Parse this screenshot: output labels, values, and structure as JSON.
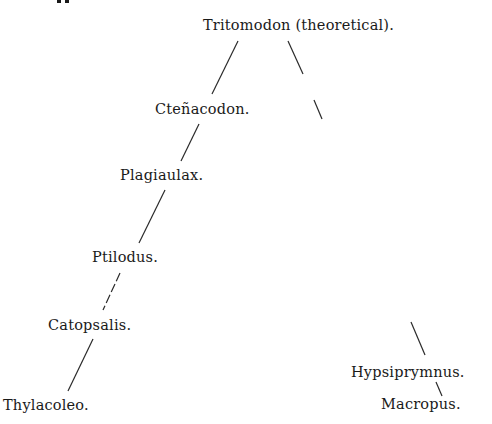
{
  "figure": {
    "type": "phylogenetic-tree",
    "top_cropped_text": "pp"
  },
  "nodes": {
    "root": "Tritomodon (theoretical).",
    "ctenacodon": "Cteñacodon.",
    "plagiaulax": "Plagiaulax.",
    "ptilodus": "Ptilodus.",
    "catopsalis": "Catopsalis.",
    "thylacoleo": "Thylacoleo.",
    "hypsiprymnus": "Hypsiprymnus.",
    "macropus": "Macropus."
  },
  "edges": [
    {
      "from": "root",
      "to": "ctenacodon",
      "style": "solid"
    },
    {
      "from": "ctenacodon",
      "to": "plagiaulax",
      "style": "solid"
    },
    {
      "from": "plagiaulax",
      "to": "ptilodus",
      "style": "solid"
    },
    {
      "from": "ptilodus",
      "to": "catopsalis",
      "style": "dashed"
    },
    {
      "from": "catopsalis",
      "to": "thylacoleo",
      "style": "solid"
    },
    {
      "from": "root",
      "to": "hypsiprymnus",
      "style": "broken"
    },
    {
      "from": "hypsiprymnus",
      "to": "macropus",
      "style": "solid"
    }
  ]
}
